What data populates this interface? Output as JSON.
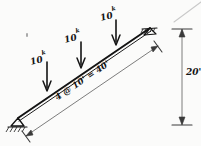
{
  "figure": {
    "ink_color": "#141414",
    "paper_color": "#fbfbfa",
    "faint_color": "#b9b9b9"
  },
  "beam": {
    "label": "beam-member",
    "left_end": {
      "x": 18,
      "y": 118
    },
    "right_end": {
      "x": 150,
      "y": 28
    }
  },
  "supports": [
    {
      "name": "pin-support-left",
      "type": "pin",
      "x": 18,
      "y": 118
    },
    {
      "name": "support-right",
      "type": "pin",
      "x": 150,
      "y": 28
    }
  ],
  "loads": [
    {
      "name": "point-load-1",
      "magnitude": "10",
      "unit": "k",
      "label": "10",
      "sup": "k",
      "tip_x": 47,
      "tip_y": 90,
      "tail_y": 62
    },
    {
      "name": "point-load-2",
      "magnitude": "10",
      "unit": "k",
      "label": "10",
      "sup": "k",
      "tip_x": 81,
      "tip_y": 67,
      "tail_y": 42
    },
    {
      "name": "point-load-3",
      "magnitude": "10",
      "unit": "k",
      "label": "10",
      "sup": "k",
      "tip_x": 116,
      "tip_y": 44,
      "tail_y": 20
    }
  ],
  "dimensions": {
    "span": {
      "name": "span-dimension",
      "text": "4 @ 10' = 40'",
      "spaces": "4",
      "spacing": "10'",
      "total": "40'"
    },
    "rise": {
      "name": "rise-dimension",
      "text": "20'",
      "value": "20",
      "unit": "'"
    }
  },
  "artifacts": {
    "speck": "scan-speck",
    "corner_streak": "scan-streak"
  }
}
